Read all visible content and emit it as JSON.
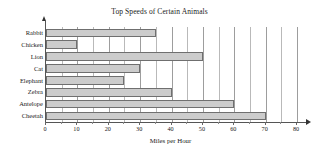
{
  "chart_data": {
    "type": "bar",
    "orientation": "horizontal",
    "title": "Top Speeds of Certain Animals",
    "xlabel": "Miles per Hour",
    "ylabel": "",
    "categories": [
      "Rabbit",
      "Chicken",
      "Lion",
      "Cat",
      "Elephant",
      "Zebra",
      "Antelope",
      "Cheetah"
    ],
    "values": [
      35,
      10,
      50,
      30,
      25,
      40,
      60,
      70
    ],
    "xlim": [
      0,
      80
    ],
    "xticks": [
      0,
      10,
      20,
      30,
      40,
      50,
      60,
      70,
      80
    ],
    "xtick_labels": [
      "0",
      "10",
      "20",
      "30",
      "40",
      "50",
      "60",
      "70",
      "80"
    ],
    "minor_tick_step": 5,
    "grid": "vertical",
    "legend": "none",
    "bar_fill_color": "#cccccc",
    "bar_edge_color": "#6f6f6f",
    "gridline_color": "#b9b9b9",
    "axis_color": "#555555",
    "background_color": "#ffffff"
  }
}
